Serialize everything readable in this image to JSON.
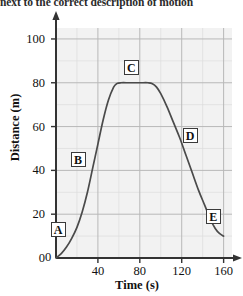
{
  "instruction": {
    "text": "next to the correct description of motion"
  },
  "chart_data": {
    "type": "line",
    "title": "",
    "xlabel": "Time (s)",
    "ylabel": "Distance (m)",
    "xlim": [
      0,
      168
    ],
    "ylim": [
      0,
      105
    ],
    "xticks": [
      0,
      40,
      80,
      120,
      160
    ],
    "yticks": [
      0,
      20,
      40,
      60,
      80,
      100
    ],
    "xtick_labels": [
      "0",
      "40",
      "80",
      "120",
      "160"
    ],
    "ytick_labels": [
      "0",
      "20",
      "40",
      "60",
      "80",
      "100"
    ],
    "x_minor_step": 20,
    "y_minor_step": 10,
    "grid": true,
    "grid_major_color": "#b8b8b8",
    "grid_minor_color": "#dddddd",
    "plot_bg_color": "#f2f2f2",
    "line_color": "#4a4a4a",
    "legend": null,
    "series": [
      {
        "name": "Distance vs Time",
        "x": [
          0,
          5,
          10,
          15,
          20,
          25,
          30,
          35,
          40,
          45,
          50,
          55,
          58,
          62,
          70,
          80,
          88,
          92,
          96,
          100,
          106,
          112,
          118,
          124,
          130,
          136,
          142,
          148,
          152,
          156,
          160
        ],
        "y": [
          0,
          2,
          5,
          9,
          14,
          21,
          30,
          41,
          52,
          63,
          72,
          78,
          79.6,
          80,
          80,
          80,
          80,
          79.6,
          78,
          75,
          69,
          62,
          55,
          47,
          39,
          31,
          24,
          17,
          13.5,
          11.2,
          10
        ]
      }
    ],
    "annotations": [
      {
        "label": "A",
        "x": 2,
        "y": 13
      },
      {
        "label": "B",
        "x": 21,
        "y": 45
      },
      {
        "label": "C",
        "x": 72,
        "y": 87
      },
      {
        "label": "D",
        "x": 128,
        "y": 56
      },
      {
        "label": "E",
        "x": 150,
        "y": 19
      }
    ]
  }
}
